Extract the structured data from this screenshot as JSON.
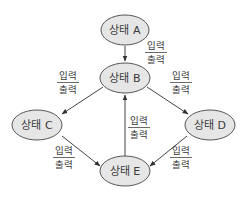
{
  "diagram": {
    "type": "state-transition",
    "nodes": [
      {
        "id": "A",
        "label": "상태 A"
      },
      {
        "id": "B",
        "label": "상태 B"
      },
      {
        "id": "C",
        "label": "상태 C"
      },
      {
        "id": "D",
        "label": "상태 D"
      },
      {
        "id": "E",
        "label": "상태 E"
      }
    ],
    "edges": [
      {
        "from": "A",
        "to": "B",
        "input": "입력",
        "output": "출력"
      },
      {
        "from": "B",
        "to": "C",
        "input": "입력",
        "output": "출력"
      },
      {
        "from": "B",
        "to": "D",
        "input": "입력",
        "output": "출력"
      },
      {
        "from": "E",
        "to": "B",
        "input": "입력",
        "output": "출력"
      },
      {
        "from": "C",
        "to": "E",
        "input": "입력",
        "output": "출력"
      },
      {
        "from": "D",
        "to": "E",
        "input": "입력",
        "output": "출력"
      }
    ],
    "colors": {
      "node_fill": "#e6e6e6",
      "node_stroke": "#555555",
      "edge": "#444444",
      "text": "#3a3a3a"
    }
  }
}
